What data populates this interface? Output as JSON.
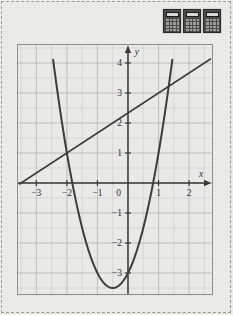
{
  "page": {
    "background_color": "#e8e8e6",
    "border_style": "dashed",
    "border_color": "#9a9a98"
  },
  "toolbar": {
    "name": "calculator-icon-strip",
    "icons": [
      {
        "name": "calculator-icon-1",
        "label": "calculator-icon"
      },
      {
        "name": "calculator-icon-2",
        "label": "calculator-icon"
      },
      {
        "name": "calculator-icon-3",
        "label": "calculator-icon"
      }
    ]
  },
  "chart_data": {
    "type": "line",
    "title": "",
    "xlabel": "x",
    "ylabel": "y",
    "xlim": [
      -3.6,
      2.75
    ],
    "ylim": [
      -3.7,
      4.6
    ],
    "grid": true,
    "grid_step": 0.5,
    "legend": "none",
    "axis_color": "#3a3a3a",
    "curve_color": "#3c3c3c",
    "grid_color": "#b9b9b7",
    "grid_minor_color": "#cfcfcd",
    "x_ticks": [
      -3,
      -2,
      -1,
      1,
      2
    ],
    "x_tick_labels": [
      "−3",
      "−2",
      "−1",
      "1",
      "2"
    ],
    "y_ticks": [
      4,
      3,
      2,
      1,
      -1,
      -2,
      -3
    ],
    "y_tick_labels": [
      "4",
      "3",
      "2",
      "1",
      "−1",
      "−2",
      "−3"
    ],
    "origin_label": "0",
    "x_axis_letter": "x",
    "y_axis_letter": "y",
    "series": [
      {
        "name": "parabola",
        "type": "quadratic",
        "equation": "y = 2x^2 + 2x - 3",
        "a": 2,
        "b": 2,
        "c": -3,
        "vertex": [
          -0.5,
          -3.5
        ],
        "x_range": [
          -2.45,
          1.45
        ],
        "points": [
          [
            -2.45,
            3.5
          ],
          [
            -2.2,
            2.28
          ],
          [
            -2.0,
            1.0
          ],
          [
            -1.75,
            -0.38
          ],
          [
            -1.5,
            -1.5
          ],
          [
            -1.25,
            -2.38
          ],
          [
            -1.0,
            -3.0
          ],
          [
            -0.75,
            -3.38
          ],
          [
            -0.5,
            -3.5
          ],
          [
            -0.25,
            -3.38
          ],
          [
            0.0,
            -3.0
          ],
          [
            0.25,
            -2.38
          ],
          [
            0.5,
            -1.5
          ],
          [
            0.75,
            -0.38
          ],
          [
            1.0,
            1.0
          ],
          [
            1.25,
            2.63
          ],
          [
            1.45,
            4.11
          ]
        ]
      },
      {
        "name": "line",
        "type": "linear",
        "equation": "y = (2/3)x + 7/3",
        "slope": 0.6667,
        "intercept": 2.3333,
        "x_range": [
          -3.55,
          2.7
        ],
        "points": [
          [
            -3.55,
            -0.03
          ],
          [
            2.7,
            4.13
          ]
        ]
      }
    ],
    "intersections": [
      [
        -2,
        1
      ],
      [
        1,
        3
      ]
    ]
  }
}
